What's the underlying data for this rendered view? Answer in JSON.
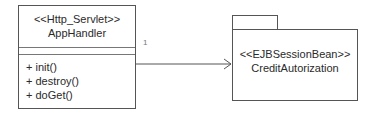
{
  "class_box": {
    "stereotype": "<<Http_Servlet>>",
    "name": "AppHandler",
    "operations": [
      "+ init()",
      "+ destroy()",
      "+ doGet()"
    ]
  },
  "association": {
    "multiplicity": "1"
  },
  "package": {
    "stereotype": "<<EJBSessionBean>>",
    "name": "CreditAutorization"
  }
}
